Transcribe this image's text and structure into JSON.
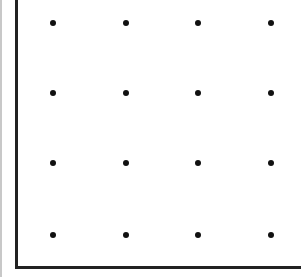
{
  "diagram": {
    "type": "dot-grid",
    "rows": 4,
    "cols": 4,
    "dot_color": "#111111",
    "border_color": "#222222",
    "x_positions": [
      53,
      126,
      198,
      271
    ],
    "y_positions": [
      23,
      93,
      163,
      235
    ]
  }
}
